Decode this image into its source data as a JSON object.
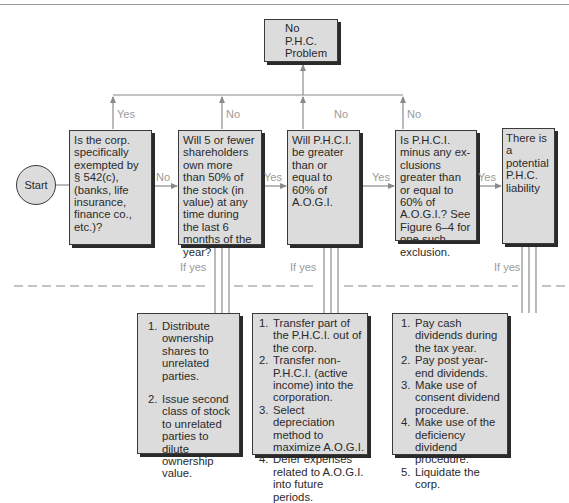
{
  "start": {
    "label": "Start"
  },
  "top_result": {
    "lines": [
      "No",
      "P.H.C.",
      "Problem"
    ]
  },
  "decisions": [
    {
      "id": "exempt",
      "text": "Is the corp. specifically exempted by § 542(c), (banks, life insurance, finance co., etc.)?",
      "up_label": "Yes",
      "next_label": "No"
    },
    {
      "id": "shareholders",
      "text": "Will 5 or fewer shareholders own more than 50% of the stock (in value) at any time during the last 6 months of the year?",
      "up_label": "No",
      "next_label": "Yes"
    },
    {
      "id": "phci60",
      "text": "Will P.H.C.I. be greater than or equal to 60% of A.O.G.I.",
      "up_label": "No",
      "next_label": "Yes"
    },
    {
      "id": "phci_excl",
      "text": "Is P.H.C.I. minus any ex-clusions greater than or equal to 60% of A.O.G.I.? See Figure 6–4 for one such exclusion.",
      "up_label": "No",
      "next_label": "Yes"
    },
    {
      "id": "liability",
      "text": "There is a potential P.H.C. liability"
    }
  ],
  "if_yes_label": "If yes",
  "actions": [
    {
      "id": "ownership",
      "items": [
        "Distribute ownership shares to unrelated parties.",
        "Issue second class of stock to unrelated parties to dilute ownership value."
      ]
    },
    {
      "id": "income",
      "items": [
        "Transfer part of the P.H.C.I. out of the corp.",
        "Transfer non-P.H.C.I. (active income) into the corporation.",
        "Select depreciation method to maximize A.O.G.I.",
        "Defer expenses related to A.O.G.I. into future periods."
      ]
    },
    {
      "id": "dividends",
      "items": [
        "Pay cash dividends during the tax year.",
        "Pay post year-end dividends.",
        "Make use of consent dividend procedure.",
        "Make use of the deficiency dividend procedure.",
        "Liquidate the corp."
      ]
    }
  ],
  "colors": {
    "box_fill": "#dcdcdc",
    "border": "#3a3a3a",
    "line": "#8a8a8a",
    "label": "#9a9a9a"
  }
}
